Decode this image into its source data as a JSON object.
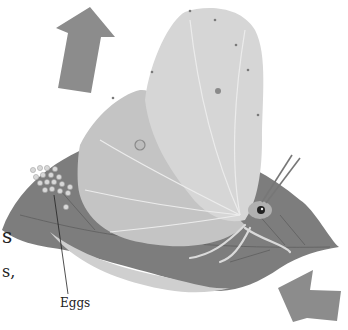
{
  "illustration": {
    "subject": "butterfly laying eggs on a leaf",
    "labels": {
      "eggs": "Eggs"
    },
    "text_fragments": [
      "s",
      "s,",
      ","
    ],
    "arrows": [
      {
        "name": "arrow-up",
        "direction": "up"
      },
      {
        "name": "arrow-up-left",
        "direction": "up-left"
      }
    ],
    "colors": {
      "arrow": "#8c8c8c",
      "leaf_dark": "#7a7a7a",
      "leaf_mid": "#9a9a9a",
      "leaf_light": "#cfcfcf",
      "wing": "#c9c9c9",
      "wing_light": "#dedede",
      "eggs": "#d8d8d8",
      "text": "#222222"
    }
  }
}
